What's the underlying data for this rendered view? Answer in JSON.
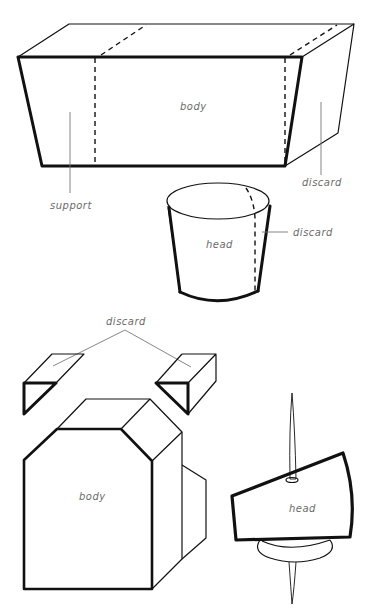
{
  "diagram": {
    "top_section": {
      "box": {
        "body_label": "body",
        "left_label": "support",
        "right_label": "discard"
      },
      "cup": {
        "center_label": "head",
        "side_label": "discard"
      }
    },
    "bottom_section": {
      "top_label": "discard",
      "body_label": "body",
      "head_label": "head"
    }
  }
}
